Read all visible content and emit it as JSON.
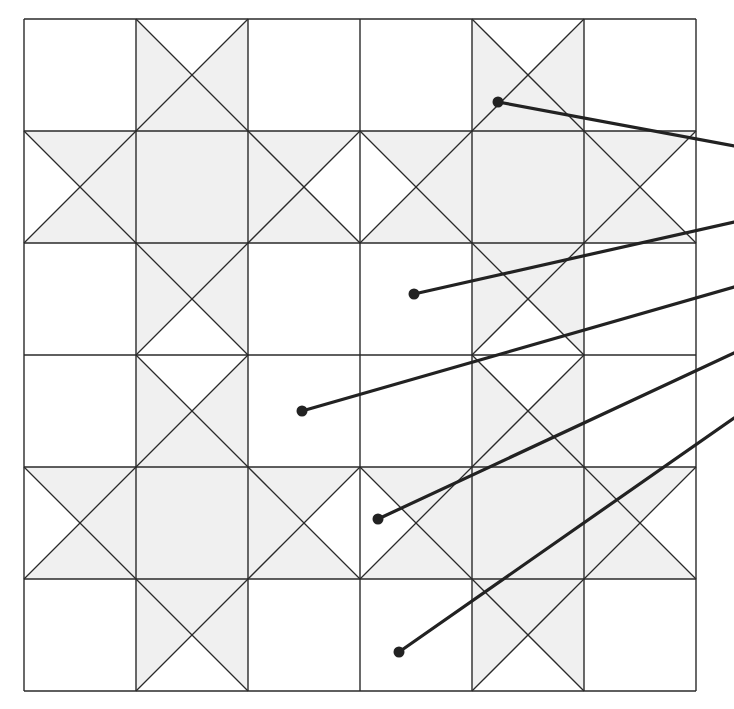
{
  "diagram": {
    "type": "quilt-block-pattern",
    "colors": {
      "background": "#ffffff",
      "grid_line": "#2a2a2a",
      "shaded_fill": "#f0f0f0",
      "leader_line": "#222222"
    },
    "grid": {
      "left": 24,
      "top": 19,
      "cell": 112,
      "rows": 6,
      "cols": 6
    },
    "blocks": [
      {
        "name": "ohio-star-top-left",
        "row": 0,
        "col": 0
      },
      {
        "name": "ohio-star-top-right",
        "row": 0,
        "col": 3
      },
      {
        "name": "ohio-star-bottom-left",
        "row": 3,
        "col": 0
      },
      {
        "name": "ohio-star-bottom-right",
        "row": 3,
        "col": 3
      }
    ],
    "leaders": [
      {
        "name": "leader-1",
        "dot": [
          498,
          102
        ],
        "end": [
          734,
          146
        ]
      },
      {
        "name": "leader-2",
        "dot": [
          414,
          294
        ],
        "end": [
          734,
          222
        ]
      },
      {
        "name": "leader-3",
        "dot": [
          302,
          411
        ],
        "end": [
          734,
          287
        ]
      },
      {
        "name": "leader-4",
        "dot": [
          378,
          519
        ],
        "end": [
          734,
          353
        ]
      },
      {
        "name": "leader-5",
        "dot": [
          399,
          652
        ],
        "end": [
          734,
          418
        ]
      }
    ]
  }
}
